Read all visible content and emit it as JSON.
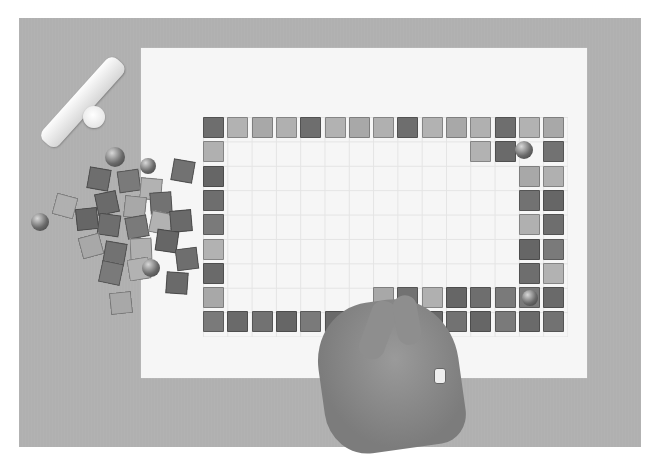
{
  "scene": {
    "description": "Photograph of a hand placing glass mosaic tiles in a rectangular border on a gridded white paper sheet over a grey surface; loose tiles, glass gems and a glue tube at left.",
    "grid": {
      "columns": 15,
      "rows": 9
    },
    "colors": {
      "background_surface": "#b0b0b0",
      "paper": "#f6f6f6",
      "tile_dark": "#6a6a6a",
      "tile_mid": "#888888",
      "tile_light": "#b4b4b4"
    }
  }
}
